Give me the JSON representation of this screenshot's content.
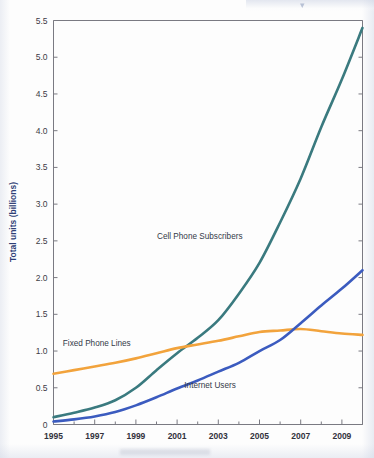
{
  "chart_data": {
    "type": "line",
    "title": "",
    "subtitle": "",
    "xlabel": "",
    "ylabel": "Total units (billions)",
    "xlim": [
      1995,
      2010
    ],
    "ylim": [
      0,
      5.5
    ],
    "grid": false,
    "legend_position": "inline-annotations",
    "x": [
      1995,
      1996,
      1997,
      1998,
      1999,
      2000,
      2001,
      2002,
      2003,
      2004,
      2005,
      2006,
      2007,
      2008,
      2009,
      2010
    ],
    "xticks": [
      "1995",
      "1997",
      "1999",
      "2001",
      "2003",
      "2005",
      "2007",
      "2009"
    ],
    "xtick_values": [
      1995,
      1997,
      1999,
      2001,
      2003,
      2005,
      2007,
      2009
    ],
    "yticks": [
      "0",
      "0.5",
      "1.0",
      "1.5",
      "2.0",
      "2.5",
      "3.0",
      "3.5",
      "4.0",
      "4.5",
      "5.0",
      "5.5"
    ],
    "ytick_values": [
      0,
      0.5,
      1.0,
      1.5,
      2.0,
      2.5,
      3.0,
      3.5,
      4.0,
      4.5,
      5.0,
      5.5
    ],
    "series": [
      {
        "name": "Cell Phone Subscribers",
        "color": "#3a7a7f",
        "label_x": 2002.1,
        "label_y": 2.52,
        "values": [
          0.1,
          0.16,
          0.23,
          0.33,
          0.5,
          0.74,
          0.97,
          1.18,
          1.42,
          1.78,
          2.2,
          2.75,
          3.35,
          4.05,
          4.7,
          5.4
        ]
      },
      {
        "name": "Fixed Phone Lines",
        "color": "#f2a33c",
        "label_x": 1997.1,
        "label_y": 1.07,
        "values": [
          0.69,
          0.74,
          0.79,
          0.84,
          0.9,
          0.97,
          1.04,
          1.09,
          1.14,
          1.2,
          1.26,
          1.28,
          1.3,
          1.27,
          1.24,
          1.22
        ]
      },
      {
        "name": "Internet Users",
        "color": "#3b5bbf",
        "label_x": 2002.6,
        "label_y": 0.5,
        "values": [
          0.04,
          0.07,
          0.11,
          0.17,
          0.26,
          0.37,
          0.49,
          0.6,
          0.72,
          0.84,
          1.0,
          1.15,
          1.38,
          1.62,
          1.85,
          2.1
        ]
      }
    ]
  },
  "annotations": {
    "cell_phone_label": "Cell Phone Subscribers",
    "fixed_phone_label": "Fixed Phone Lines",
    "internet_label": "Internet Users"
  }
}
